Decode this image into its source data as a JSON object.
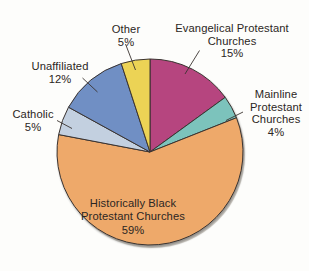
{
  "chart_data": {
    "type": "pie",
    "title": "",
    "subtitle": "",
    "xlabel": "",
    "ylabel": "",
    "legend_position": "none",
    "grid": false,
    "units": "percent",
    "total": 100,
    "categories": [
      "Evangelical Protestant Churches",
      "Mainline Protestant Churches",
      "Historically Black Protestant Churches",
      "Catholic",
      "Unaffiliated",
      "Other"
    ],
    "values": [
      15,
      4,
      59,
      5,
      12,
      5
    ],
    "slices": [
      {
        "name": "evangelical-protestant-churches",
        "label": "Evangelical Protestant\nChurches",
        "value": 15,
        "percent_text": "15%",
        "color": "#b6457f",
        "start_angle": 0,
        "end_angle": 54
      },
      {
        "name": "mainline-protestant-churches",
        "label": "Mainline\nProtestant\nChurches",
        "value": 4,
        "percent_text": "4%",
        "color": "#7cc3bc",
        "start_angle": 54,
        "end_angle": 68.4
      },
      {
        "name": "historically-black-protestant-churches",
        "label": "Historically Black\nProtestant Churches",
        "value": 59,
        "percent_text": "59%",
        "color": "#eea96a",
        "start_angle": 68.4,
        "end_angle": 280.8
      },
      {
        "name": "catholic",
        "label": "Catholic",
        "value": 5,
        "percent_text": "5%",
        "color": "#c3d0e0",
        "start_angle": 280.8,
        "end_angle": 298.8
      },
      {
        "name": "unaffiliated",
        "label": "Unaffiliated",
        "value": 12,
        "percent_text": "12%",
        "color": "#6f8fc4",
        "start_angle": 298.8,
        "end_angle": 342
      },
      {
        "name": "other",
        "label": "Other",
        "value": 5,
        "percent_text": "5%",
        "color": "#ecd355",
        "start_angle": 342,
        "end_angle": 360
      }
    ],
    "geometry": {
      "center_x": 150,
      "center_y": 152,
      "radius": 93
    },
    "colors": {
      "background": "#fdfdfb",
      "outline": "#3a3330",
      "text": "#2b2623"
    }
  },
  "labels": {
    "evangelical": {
      "name": "Evangelical Protestant\nChurches",
      "pct": "15%"
    },
    "mainline": {
      "name": "Mainline\nProtestant\nChurches",
      "pct": "4%"
    },
    "other": {
      "name": "Other",
      "pct": "5%"
    },
    "unaffiliated": {
      "name": "Unaffiliated",
      "pct": "12%"
    },
    "catholic": {
      "name": "Catholic",
      "pct": "5%"
    },
    "historically_black": {
      "name": "Historically Black\nProtestant Churches",
      "pct": "59%"
    }
  }
}
